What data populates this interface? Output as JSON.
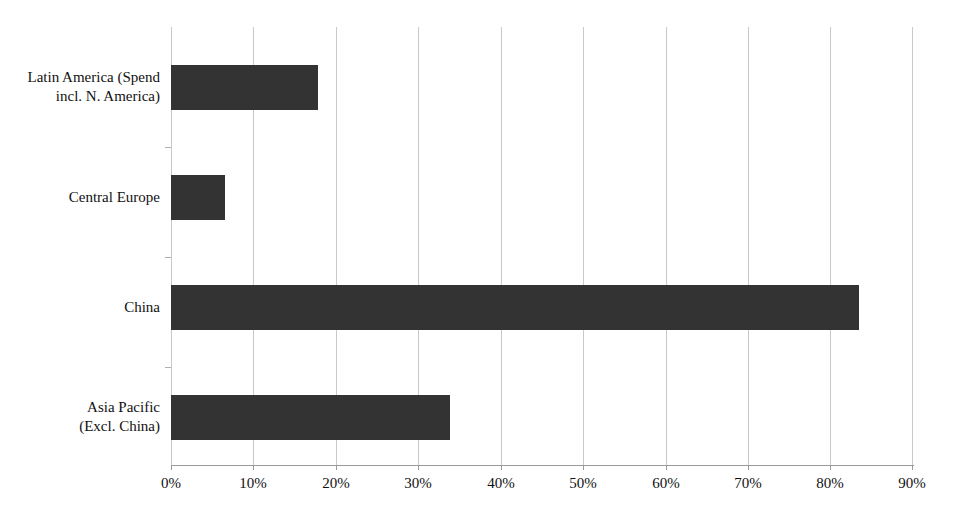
{
  "chart_data": {
    "type": "bar",
    "orientation": "horizontal",
    "title": "",
    "subtitle": "",
    "xlabel": "",
    "ylabel": "",
    "categories": [
      "Latin America (Spend incl. N. America)",
      "Central Europe",
      "China",
      "Asia Pacific (Excl. China)"
    ],
    "category_lines": [
      [
        "Latin America (Spend",
        "incl. N. America)"
      ],
      [
        "Central Europe"
      ],
      [
        "China"
      ],
      [
        "Asia Pacific",
        "(Excl. China)"
      ]
    ],
    "values": [
      17.8,
      6.6,
      83.5,
      33.8
    ],
    "value_labels": [
      "17.8%",
      "6.6%",
      "83.5%",
      "33.8%"
    ],
    "xlim": [
      0,
      90
    ],
    "xtick_values": [
      0,
      10,
      20,
      30,
      40,
      50,
      60,
      70,
      80,
      90
    ],
    "xtick_labels": [
      "0%",
      "10%",
      "20%",
      "30%",
      "40%",
      "50%",
      "60%",
      "70%",
      "80%",
      "90%"
    ],
    "grid": {
      "vertical": true,
      "horizontal": false,
      "color": "#c9c9c9"
    },
    "legend": {
      "visible": false,
      "position": "none",
      "entries": []
    },
    "colors": {
      "bar": "#333333",
      "gridline": "#c9c9c9",
      "axis": "#9a9a9a",
      "text": "#111111",
      "background": "#ffffff"
    },
    "annotations": []
  }
}
